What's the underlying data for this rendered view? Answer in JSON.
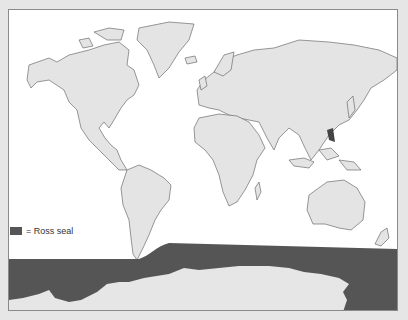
{
  "map": {
    "type": "world-distribution-map",
    "land_color": "#e4e4e4",
    "ocean_color": "#ffffff",
    "range_color": "#555555"
  },
  "legend": {
    "swatch_color": "#555555",
    "label": "= Ross seal"
  }
}
